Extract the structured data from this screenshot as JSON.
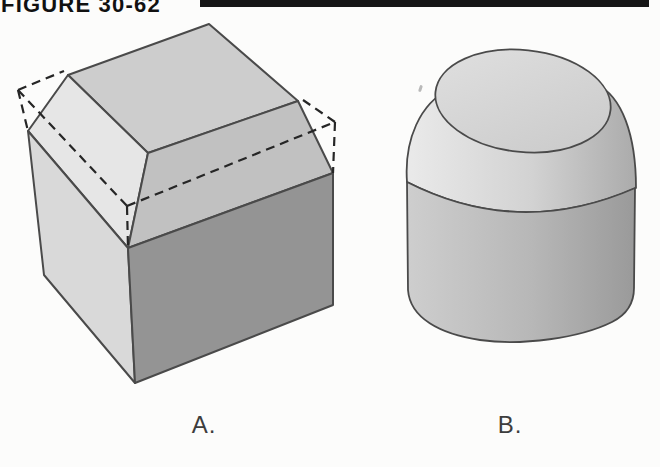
{
  "figure": {
    "title": "FIGURE 30-62",
    "illustrations": [
      {
        "id": "A",
        "caption": "A."
      },
      {
        "id": "B",
        "caption": "B."
      }
    ]
  },
  "colors": {
    "background": "#fcfcfb",
    "header_rule": "#161616",
    "title_text": "#111111",
    "caption_text": "#3d3d3d",
    "solid_edge": "#4a4a4a",
    "hidden_edge_dash": "#262626",
    "cube": {
      "top_face": "#cdcdcd",
      "chamfer_left_face": "#e6e6e6",
      "chamfer_right_face": "#c1c1c1",
      "front_left_face": "#d9d9d9",
      "front_right_face": "#949494"
    },
    "cylinder": {
      "top_face_light": "#e0e0e0",
      "top_face_dark": "#c9c9c9",
      "shoulder_light": "#eaeaea",
      "shoulder_mid": "#d2d2d2",
      "shoulder_dark": "#ababab",
      "body_light": "#cecece",
      "body_mid": "#b7b7b7",
      "body_dark": "#9a9a9a"
    }
  }
}
